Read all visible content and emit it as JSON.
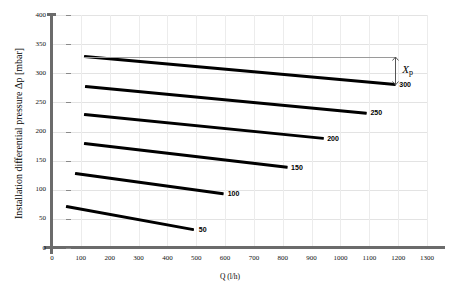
{
  "chart_data": {
    "type": "line",
    "title": "",
    "xlabel": "Q (l/h)",
    "ylabel": "Installation differential pressure Δp [mbar]",
    "xlim": [
      0,
      1300
    ],
    "ylim": [
      0,
      400
    ],
    "xticks": [
      0,
      100,
      200,
      300,
      400,
      500,
      600,
      700,
      800,
      900,
      1000,
      1100,
      1200,
      1300
    ],
    "yticks": [
      0,
      50,
      100,
      150,
      200,
      250,
      300,
      350,
      400
    ],
    "grid": true,
    "legend_position": "inline-end-labels",
    "series": [
      {
        "name": "50",
        "label": "50",
        "x": [
          50,
          495
        ],
        "y": [
          72,
          32
        ]
      },
      {
        "name": "100",
        "label": "100",
        "x": [
          80,
          595
        ],
        "y": [
          128,
          93
        ]
      },
      {
        "name": "150",
        "label": "150",
        "x": [
          110,
          815
        ],
        "y": [
          179,
          138
        ]
      },
      {
        "name": "200",
        "label": "200",
        "x": [
          110,
          940
        ],
        "y": [
          229,
          188
        ]
      },
      {
        "name": "250",
        "label": "250",
        "x": [
          115,
          1090
        ],
        "y": [
          278,
          232
        ]
      },
      {
        "name": "300",
        "label": "300",
        "x": [
          110,
          1190
        ],
        "y": [
          328,
          280
        ]
      }
    ],
    "annotations": [
      {
        "name": "Xp",
        "label": "X",
        "sublabel": "p",
        "type": "vertical-span-arrow",
        "x": 1190,
        "y_top": 328,
        "y_bottom": 280,
        "reference_line_from_x": 110,
        "reference_line_y": 328
      }
    ],
    "colors": {
      "curve": "#000000",
      "axis": "#6b6b6b",
      "gridline_horizontal": "#e3e3e3",
      "gridline_vertical": "#ececec",
      "annotation_line": "#9a9a9a",
      "background": "#ffffff"
    }
  }
}
